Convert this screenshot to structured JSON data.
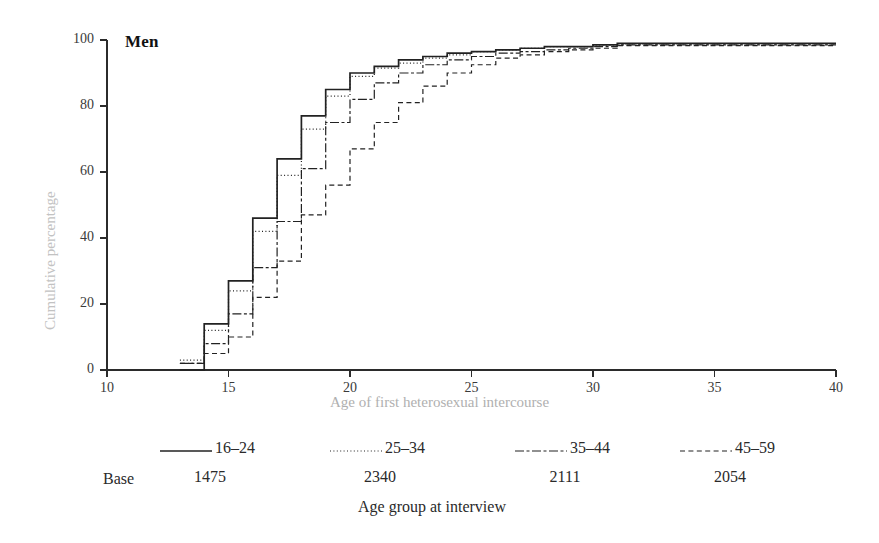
{
  "figure": {
    "panel_label": "Men",
    "y_axis_title": "Cumulative percentage",
    "x_axis_title": "Age of first heterosexual intercourse",
    "legend_caption": "Age group at interview",
    "base_word": "Base",
    "ink_color": "#1a1a1a",
    "axis_label_color": "#b8b8b8"
  },
  "chart_data": {
    "type": "line",
    "title": "Men",
    "xlabel": "Age of first heterosexual intercourse",
    "ylabel": "Cumulative percentage",
    "xlim": [
      10,
      40
    ],
    "ylim": [
      0,
      100
    ],
    "xticks": [
      10,
      15,
      20,
      25,
      30,
      35,
      40
    ],
    "yticks": [
      0,
      20,
      40,
      60,
      80,
      100
    ],
    "grid": false,
    "step_style": "post",
    "legend_position": "below",
    "legend_caption": "Age group at interview",
    "series": [
      {
        "name": "16-24",
        "base": 1475,
        "dash": "solid",
        "x": [
          13,
          14,
          15,
          16,
          17,
          18,
          19,
          20,
          21,
          22,
          23,
          24,
          25,
          26,
          27,
          28,
          29,
          30,
          31,
          32,
          33,
          34,
          35,
          36,
          37,
          38,
          39,
          40
        ],
        "y": [
          0,
          14,
          27,
          46,
          64,
          77,
          85,
          90,
          92,
          94,
          95,
          96,
          96.5,
          97,
          97.5,
          98,
          98,
          98.5,
          99,
          99,
          99,
          99,
          99,
          99,
          99,
          99,
          99,
          99
        ]
      },
      {
        "name": "25-34",
        "base": 2340,
        "dash": "dotted",
        "x": [
          13,
          14,
          15,
          16,
          17,
          18,
          19,
          20,
          21,
          22,
          23,
          24,
          25,
          26,
          27,
          28,
          29,
          30,
          31,
          32,
          33,
          34,
          35,
          36,
          37,
          38,
          39,
          40
        ],
        "y": [
          3,
          12,
          24,
          42,
          59,
          73,
          83,
          89,
          91.5,
          93,
          94.5,
          95.5,
          96.5,
          97,
          97.5,
          98,
          98,
          98.5,
          98.8,
          98.8,
          98.8,
          98.8,
          98.8,
          98.8,
          98.8,
          98.8,
          98.8,
          98.8
        ]
      },
      {
        "name": "35-44",
        "base": 2111,
        "dash": "dashdot",
        "x": [
          13,
          14,
          15,
          16,
          17,
          18,
          19,
          20,
          21,
          22,
          23,
          24,
          25,
          26,
          27,
          28,
          29,
          30,
          31,
          32,
          33,
          34,
          35,
          36,
          37,
          38,
          39,
          40
        ],
        "y": [
          2,
          8,
          17,
          31,
          45,
          61,
          75,
          82,
          87,
          90,
          92.5,
          94,
          95,
          96,
          96.5,
          97,
          97.5,
          98,
          98.5,
          98.5,
          98.5,
          98.5,
          98.5,
          98.5,
          98.5,
          98.5,
          98.5,
          98.5
        ]
      },
      {
        "name": "45-59",
        "base": 2054,
        "dash": "dashed",
        "x": [
          13,
          14,
          15,
          16,
          17,
          18,
          19,
          20,
          21,
          22,
          23,
          24,
          25,
          26,
          27,
          28,
          29,
          30,
          31,
          32,
          33,
          34,
          35,
          36,
          37,
          38,
          39,
          40
        ],
        "y": [
          2,
          5,
          10,
          22,
          33,
          47,
          56,
          67,
          75,
          81,
          86,
          90,
          92.5,
          94.5,
          95.5,
          96.5,
          97,
          97.5,
          98.3,
          98.3,
          98.3,
          98.3,
          98.3,
          98.3,
          98.3,
          98.3,
          98.3,
          98.3
        ]
      }
    ]
  },
  "legend": {
    "entries": [
      {
        "label": "16-24",
        "base": "1475"
      },
      {
        "label": "25-34",
        "base": "2340"
      },
      {
        "label": "35-44",
        "base": "2111"
      },
      {
        "label": "45-59",
        "base": "2054"
      }
    ]
  },
  "axis": {
    "y_tick_labels": [
      "100",
      "80",
      "60",
      "40",
      "20",
      "0"
    ],
    "x_tick_labels": [
      "10",
      "15",
      "20",
      "25",
      "30",
      "35",
      "40"
    ]
  }
}
